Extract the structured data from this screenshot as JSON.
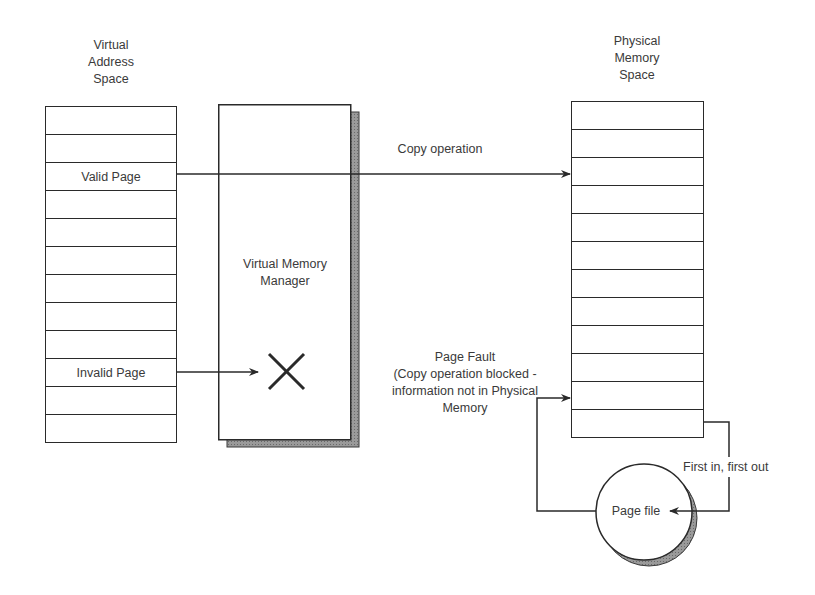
{
  "virtual_space": {
    "title_lines": [
      "Virtual",
      "Address",
      "Space"
    ],
    "rows": [
      "",
      "",
      "Valid Page",
      "",
      "",
      "",
      "",
      "",
      "",
      "Invalid Page",
      "",
      ""
    ]
  },
  "vmm": {
    "label_lines": [
      "Virtual Memory",
      "Manager"
    ],
    "blocked_icon": "x-cross-icon"
  },
  "physical_space": {
    "title_lines": [
      "Physical",
      "Memory",
      "Space"
    ],
    "rows": [
      "",
      "",
      "",
      "",
      "",
      "",
      "",
      "",
      "",
      "",
      "",
      ""
    ]
  },
  "copy_operation": {
    "label": "Copy operation"
  },
  "page_fault": {
    "lines": [
      "Page Fault",
      "(Copy operation blocked -",
      "information not in Physical",
      "Memory"
    ]
  },
  "page_file": {
    "label": "Page file"
  },
  "fifo": {
    "label": "First in, first out"
  },
  "colors": {
    "line": "#2a2a2a",
    "shadow": "#8a8a8a",
    "text": "#3a3a3a"
  }
}
